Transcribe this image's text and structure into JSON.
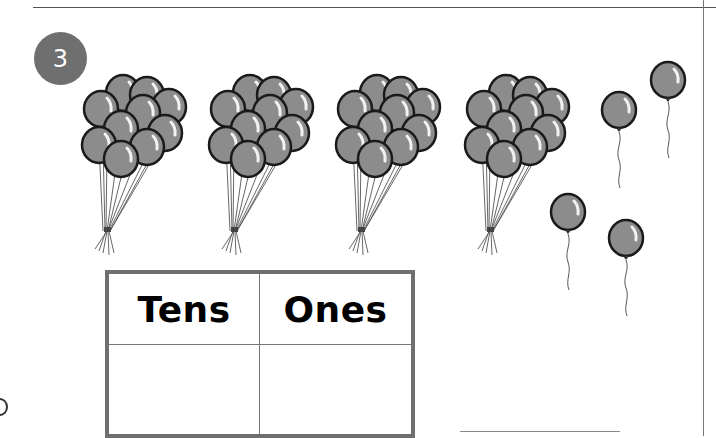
{
  "exercise": {
    "number": "3",
    "badge_color": "#6f6f6f"
  },
  "illustration": {
    "description": "Four bunches of ten balloons and four single balloons",
    "bunches": [
      {
        "count": 10,
        "x": 85,
        "y": 73
      },
      {
        "count": 10,
        "x": 212,
        "y": 73
      },
      {
        "count": 10,
        "x": 339,
        "y": 73
      },
      {
        "count": 10,
        "x": 468,
        "y": 73
      }
    ],
    "singles": [
      {
        "cx": 619,
        "cy": 110
      },
      {
        "cx": 668,
        "cy": 80
      },
      {
        "cx": 568,
        "cy": 212
      },
      {
        "cx": 626,
        "cy": 238
      }
    ],
    "balloon_color": "#8c8c8c",
    "total_tens": 4,
    "total_ones": 4
  },
  "place_value_table": {
    "headers": [
      "Tens",
      "Ones"
    ],
    "answers": [
      "",
      ""
    ]
  }
}
